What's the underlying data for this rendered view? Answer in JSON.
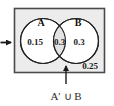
{
  "diagram": {
    "type": "venn-two-set",
    "universe": {
      "name": "universal-set-rectangle",
      "fill": "#ececec",
      "border": "#4a4a4a",
      "outside_value": "0.25"
    },
    "sets": [
      {
        "key": "A",
        "label": "A",
        "only_value": "0.15",
        "fill": "#ffffff"
      },
      {
        "key": "B",
        "label": "B",
        "only_value": "0.3",
        "fill": "#ffffff"
      }
    ],
    "intersection": {
      "name": "intersection-region",
      "value": "0.3",
      "fill": "#e3e3e3"
    },
    "caption": "A′ ∪ B",
    "pointer_arrow": {
      "name": "caption-pointer-arrow",
      "direction": "up"
    },
    "side_arrow": {
      "name": "left-pointer-arrow",
      "direction": "right"
    },
    "colors": {
      "ink": "#1a1a1a",
      "stroke": "#333333",
      "panel": "#ececec"
    }
  }
}
